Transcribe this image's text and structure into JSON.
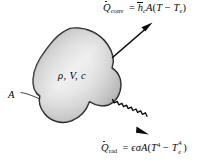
{
  "figure": {
    "background_color": "#ffffff",
    "ink_color": "#0b0b0b"
  },
  "body_shape": {
    "name": "irregular-blob",
    "label": "rho, V, c",
    "fill_light": "#ffffff",
    "fill_shadow": "#b9b9b9",
    "outline_color": "#151515"
  },
  "labels": {
    "area": "A",
    "properties": {
      "density": "ρ",
      "volume": "V",
      "specific_heat": "c",
      "text": "ρ, V, c"
    }
  },
  "arrows": {
    "convection": {
      "name": "convection-arrow",
      "style": "straight",
      "direction": "up-right",
      "from": [
        113,
        57
      ],
      "to": [
        152,
        23
      ]
    },
    "radiation": {
      "name": "radiation-arrow",
      "style": "wavy",
      "direction": "down-right",
      "from": [
        113,
        100
      ],
      "to": [
        148,
        134
      ]
    },
    "leader": {
      "name": "area-leader-line",
      "from": [
        22,
        93
      ],
      "to": [
        40,
        99
      ]
    }
  },
  "equations": {
    "convection": {
      "lhs_symbol": "Q",
      "lhs_accent": "dot",
      "lhs_subscript": "conv",
      "equals": "=",
      "coefficient_symbol": "h",
      "coefficient_accent": "bar",
      "coefficient_subscript": "c",
      "area": "A",
      "open_paren": "(",
      "temp": "T",
      "minus": "−",
      "temp_env": "T",
      "temp_env_subscript": "e",
      "close_paren": ")",
      "plain_text": "Q̇_conv = h̄_c A(T − T_e)"
    },
    "radiation": {
      "lhs_symbol": "Q",
      "lhs_accent": "dot",
      "lhs_subscript": "rad",
      "equals": "=",
      "emissivity": "ϵ",
      "stefan_boltzmann": "σ",
      "area": "A",
      "open_paren": "(",
      "temp": "T",
      "temp_exponent": "4",
      "minus": "−",
      "temp_env": "T",
      "temp_env_subscript": "e",
      "temp_env_exponent": "4",
      "close_paren": ")",
      "plain_text": "Q̇_rad = ϵσA(T⁴ − T_e⁴)"
    }
  }
}
